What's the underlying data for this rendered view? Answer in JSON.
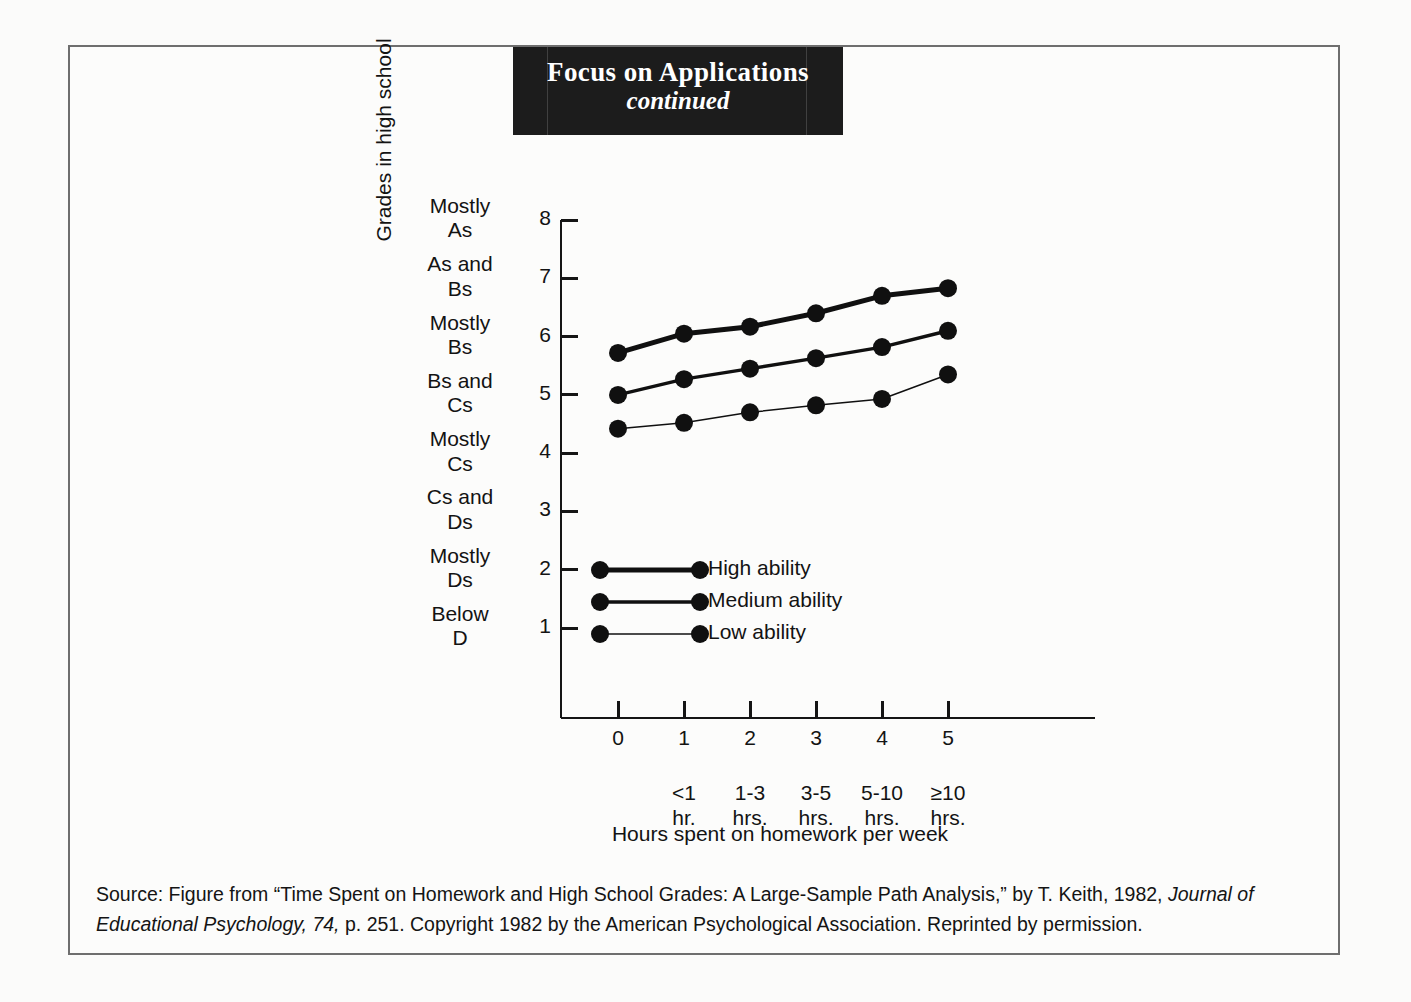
{
  "banner": {
    "title": "Focus on Applications",
    "subtitle": "continued"
  },
  "chart_data": {
    "type": "line",
    "title": "",
    "xlabel": "Hours spent on homework per week",
    "ylabel": "Grades in high school",
    "x": [
      0,
      1,
      2,
      3,
      4,
      5
    ],
    "xtick_labels": [
      "0",
      "1",
      "2",
      "3",
      "4",
      "5"
    ],
    "x_category_labels": [
      {
        "line1": "<1",
        "line2": "hr."
      },
      {
        "line1": "1-3",
        "line2": "hrs."
      },
      {
        "line1": "3-5",
        "line2": "hrs."
      },
      {
        "line1": "5-10",
        "line2": "hrs."
      },
      {
        "line1": "≥10",
        "line2": "hrs."
      }
    ],
    "xlim": [
      -0.45,
      5.75
    ],
    "ylim": [
      0.15,
      8.25
    ],
    "ytick_values": [
      1,
      2,
      3,
      4,
      5,
      6,
      7,
      8
    ],
    "ytick_labels": [
      "1",
      "2",
      "3",
      "4",
      "5",
      "6",
      "7",
      "8"
    ],
    "y_category_labels": [
      {
        "value": 8,
        "line1": "Mostly",
        "line2": "As"
      },
      {
        "value": 7,
        "line1": "As and",
        "line2": "Bs"
      },
      {
        "value": 6,
        "line1": "Mostly",
        "line2": "Bs"
      },
      {
        "value": 5,
        "line1": "Bs and",
        "line2": "Cs"
      },
      {
        "value": 4,
        "line1": "Mostly",
        "line2": "Cs"
      },
      {
        "value": 3,
        "line1": "Cs and",
        "line2": "Ds"
      },
      {
        "value": 2,
        "line1": "Mostly",
        "line2": "Ds"
      },
      {
        "value": 1,
        "line1": "Below",
        "line2": "D"
      }
    ],
    "grid": false,
    "legend_position": "inside-lower-left",
    "series": [
      {
        "name": "High ability",
        "values": [
          5.72,
          6.05,
          6.17,
          6.4,
          6.7,
          6.83
        ],
        "line_width": 5,
        "marker_size": 9,
        "color": "#101010"
      },
      {
        "name": "Medium ability",
        "values": [
          5.0,
          5.27,
          5.45,
          5.63,
          5.82,
          6.1
        ],
        "line_width": 3.4,
        "marker_size": 9,
        "color": "#101010"
      },
      {
        "name": "Low ability",
        "values": [
          4.42,
          4.52,
          4.7,
          4.82,
          4.93,
          5.35
        ],
        "line_width": 1.5,
        "marker_size": 9,
        "color": "#101010"
      }
    ]
  },
  "source": {
    "part1": "Source: Figure from “Time Spent on Homework and High School Grades: A Large-Sample Path Analysis,” by T. Keith, 1982, ",
    "journal": "Journal of Educational Psychology, 74,",
    "part2": " p. 251. Copyright 1982 by the American Psychological Association. Reprinted by permission."
  }
}
